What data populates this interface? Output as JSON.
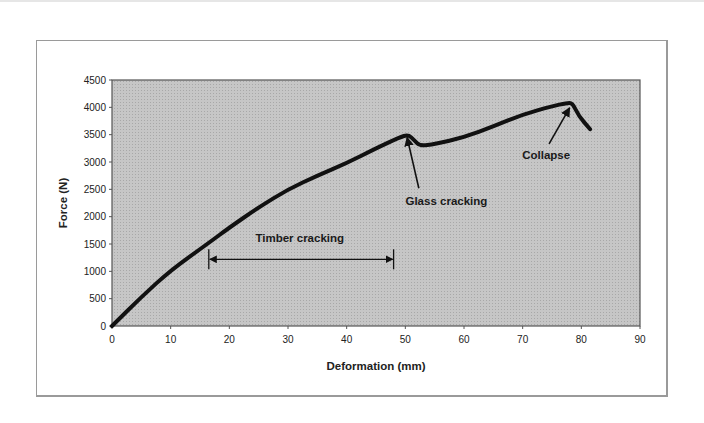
{
  "chart_data": {
    "type": "line",
    "title": "",
    "xlabel": "Deformation (mm)",
    "ylabel": "Force (N)",
    "xlim": [
      0,
      90
    ],
    "ylim": [
      0,
      4500
    ],
    "x_ticks": [
      0,
      10,
      20,
      30,
      40,
      50,
      60,
      70,
      80,
      90
    ],
    "y_ticks": [
      0,
      500,
      1000,
      1500,
      2000,
      2500,
      3000,
      3500,
      4000,
      4500
    ],
    "grid": false,
    "legend": null,
    "plot_background": "#c4c4c4",
    "series": [
      {
        "name": "Force-deformation",
        "color": "#111111",
        "x": [
          0,
          5,
          10,
          16.5,
          20,
          25,
          30,
          35,
          40,
          45,
          49,
          50.5,
          51.5,
          52.5,
          55,
          60,
          65,
          70,
          75,
          77.5,
          78.5,
          79.5,
          81.5
        ],
        "y": [
          0,
          530,
          1020,
          1520,
          1800,
          2170,
          2500,
          2750,
          2980,
          3250,
          3450,
          3500,
          3400,
          3290,
          3330,
          3450,
          3650,
          3870,
          4020,
          4080,
          4080,
          3850,
          3600
        ]
      }
    ],
    "annotations": [
      {
        "text": "Timber cracking",
        "type": "double-arrow",
        "x_start": 16.5,
        "x_end": 48,
        "y": 1220,
        "label_x": 32,
        "label_y": 1530
      },
      {
        "text": "Glass cracking",
        "type": "arrow",
        "tail": [
          52.3,
          2520
        ],
        "tip": [
          50.3,
          3450
        ],
        "label_x": 57,
        "label_y": 2220
      },
      {
        "text": "Collapse",
        "type": "arrow",
        "tail": [
          74.5,
          3330
        ],
        "tip": [
          78,
          3990
        ],
        "label_x": 74,
        "label_y": 3060
      }
    ]
  }
}
